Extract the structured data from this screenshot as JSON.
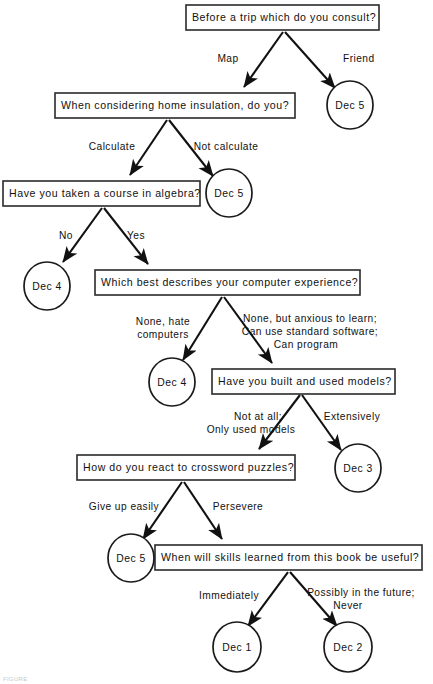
{
  "figure": {
    "caption": "FIGURE",
    "background_color": "#ffffff",
    "line_color": "#111111",
    "box_stroke_color": "#2a2a2a"
  },
  "nodes": {
    "q1": {
      "id": "q1",
      "type": "question",
      "text": "Before a trip which do you consult?"
    },
    "q2": {
      "id": "q2",
      "type": "question",
      "text": "When considering home insulation, do you?"
    },
    "q3": {
      "id": "q3",
      "type": "question",
      "text": "Have you taken a course in algebra?"
    },
    "q4": {
      "id": "q4",
      "type": "question",
      "text": "Which best describes your computer experience?"
    },
    "q5": {
      "id": "q5",
      "type": "question",
      "text": "Have you built and used models?"
    },
    "q6": {
      "id": "q6",
      "type": "question",
      "text": "How do you react to crossword puzzles?"
    },
    "q7": {
      "id": "q7",
      "type": "question",
      "text": "When will skills learned from this book be useful?"
    },
    "l1": {
      "id": "l1",
      "type": "leaf",
      "text": "Dec 5"
    },
    "l2": {
      "id": "l2",
      "type": "leaf",
      "text": "Dec 5"
    },
    "l3": {
      "id": "l3",
      "type": "leaf",
      "text": "Dec 4"
    },
    "l4": {
      "id": "l4",
      "type": "leaf",
      "text": "Dec 4"
    },
    "l5": {
      "id": "l5",
      "type": "leaf",
      "text": "Dec 3"
    },
    "l6": {
      "id": "l6",
      "type": "leaf",
      "text": "Dec 5"
    },
    "l7": {
      "id": "l7",
      "type": "leaf",
      "text": "Dec 1"
    },
    "l8": {
      "id": "l8",
      "type": "leaf",
      "text": "Dec 2"
    }
  },
  "edges": {
    "e1": {
      "from": "q1",
      "to": "q2",
      "label": "Map"
    },
    "e2": {
      "from": "q1",
      "to": "l1",
      "label": "Friend"
    },
    "e3": {
      "from": "q2",
      "to": "q3",
      "label": "Calculate"
    },
    "e4": {
      "from": "q2",
      "to": "l2",
      "label": "Not calculate"
    },
    "e5": {
      "from": "q3",
      "to": "l3",
      "label": "No"
    },
    "e6": {
      "from": "q3",
      "to": "q4",
      "label": "Yes"
    },
    "e7": {
      "from": "q4",
      "to": "l4",
      "label_line1": "None, hate",
      "label_line2": "computers"
    },
    "e8": {
      "from": "q4",
      "to": "q5",
      "label_line1": "None, but anxious to learn;",
      "label_line2": "Can use standard software;",
      "label_line3": "Can program"
    },
    "e9": {
      "from": "q5",
      "to": "q6",
      "label_line1": "Not at all;",
      "label_line2": "Only used models"
    },
    "e10": {
      "from": "q5",
      "to": "l5",
      "label": "Extensively"
    },
    "e11": {
      "from": "q6",
      "to": "l6",
      "label": "Give up easily"
    },
    "e12": {
      "from": "q6",
      "to": "q7",
      "label": "Persevere"
    },
    "e13": {
      "from": "q7",
      "to": "l7",
      "label": "Immediately"
    },
    "e14": {
      "from": "q7",
      "to": "l8",
      "label_line1": "Possibly in the future;",
      "label_line2": "Never"
    }
  }
}
